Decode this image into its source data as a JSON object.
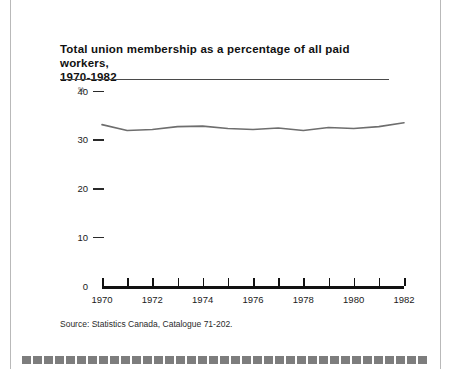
{
  "figure": {
    "title": "Total union membership as a percentage of all paid workers, 1970-1982",
    "title_line1": "Total union membership as a percentage of all paid workers,",
    "title_line2": "1970-1982",
    "source_note": "Source:   Statistics Canada, Catalogue 71-202.",
    "unit_symbol": "%"
  },
  "chart_data": {
    "type": "line",
    "title": "Total union membership as a percentage of all paid workers, 1970-1982",
    "subtitle": "",
    "xlabel": "",
    "ylabel": "%",
    "ylim": [
      0,
      44
    ],
    "xlim": [
      1970,
      1982
    ],
    "grid": false,
    "legend": "none",
    "ytick_labels": [
      "0",
      "10",
      "20",
      "30",
      "40"
    ],
    "ytick_values": [
      0,
      10,
      20,
      30,
      40
    ],
    "xtick_values": [
      1970,
      1971,
      1972,
      1973,
      1974,
      1975,
      1976,
      1977,
      1978,
      1979,
      1980,
      1981,
      1982
    ],
    "xtick_labels": [
      "1970",
      "",
      "1972",
      "",
      "1974",
      "",
      "1976",
      "",
      "1978",
      "",
      "1980",
      "",
      "1982"
    ],
    "x": [
      1970,
      1971,
      1972,
      1973,
      1974,
      1975,
      1976,
      1977,
      1978,
      1979,
      1980,
      1981,
      1982
    ],
    "values": [
      33.2,
      32.0,
      32.2,
      32.8,
      32.9,
      32.4,
      32.2,
      32.5,
      32.0,
      32.6,
      32.4,
      32.8,
      33.6
    ],
    "series_color": "#6e6e6e",
    "axis_color": "#111111"
  }
}
